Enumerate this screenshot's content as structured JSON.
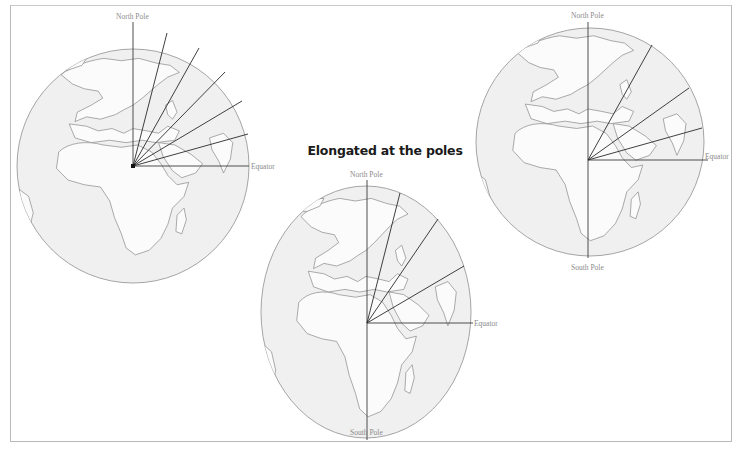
{
  "title": "Elongated at the poles",
  "labels": {
    "north_pole": "North Pole",
    "south_pole": "South Pole",
    "equator": "Equator"
  },
  "colors": {
    "frame": "#b9b9b9",
    "globe_outline": "#8f8f8f",
    "land_fill": "#ffffff",
    "sea_fill": "#f0f0f0",
    "coast": "#7f7f7f",
    "rays": "#2a2a2a",
    "axis": "#3a3a3a",
    "label": "#8a8a8a"
  },
  "globes": [
    {
      "id": "left",
      "shape": "sphere",
      "center": [
        133,
        166
      ],
      "rx": 116,
      "ry": 117,
      "labels": {
        "north": "North Pole",
        "equator": "Equator"
      },
      "ray_count": 5,
      "ray_endpoints": [
        [
          167,
          33
        ],
        [
          199,
          48
        ],
        [
          225,
          72
        ],
        [
          242,
          101
        ],
        [
          248,
          134
        ]
      ]
    },
    {
      "id": "middle",
      "shape": "prolate (elongated at the poles)",
      "center": [
        367,
        323
      ],
      "rx": 105,
      "ry": 126,
      "labels": {
        "north": "North Pole",
        "south": "South Pole",
        "equator": "Equator"
      },
      "ray_count": 3,
      "ray_endpoints": [
        [
          400,
          193
        ],
        [
          438,
          219
        ],
        [
          464,
          266
        ]
      ]
    },
    {
      "id": "right",
      "shape": "sphere",
      "center": [
        588,
        160
      ],
      "rx": 114,
      "ry": 114,
      "labels": {
        "north": "North Pole",
        "south": "South Pole",
        "equator": "Equator"
      },
      "ray_count": 3,
      "ray_endpoints": [
        [
          652,
          47
        ],
        [
          689,
          89
        ],
        [
          702,
          128
        ]
      ]
    }
  ]
}
